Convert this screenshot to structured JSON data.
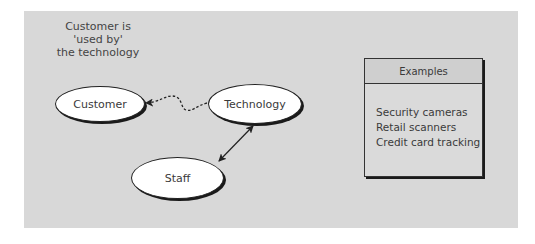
{
  "caption": {
    "lines": [
      "Customer is",
      "'used by'",
      "the technology"
    ]
  },
  "nodes": {
    "customer": "Customer",
    "technology": "Technology",
    "staff": "Staff"
  },
  "edges": [
    {
      "from": "technology",
      "to": "customer",
      "style": "dashed-curvy",
      "arrow": "to"
    },
    {
      "from": "technology",
      "to": "staff",
      "style": "solid",
      "arrow": "both"
    }
  ],
  "examples_box": {
    "title": "Examples",
    "items": [
      "Security cameras",
      "Retail scanners",
      "Credit card tracking"
    ]
  },
  "colors": {
    "background": "#ffffff",
    "panel": "#d8d8d8",
    "node_fill": "#ffffff",
    "stroke": "#222222"
  }
}
